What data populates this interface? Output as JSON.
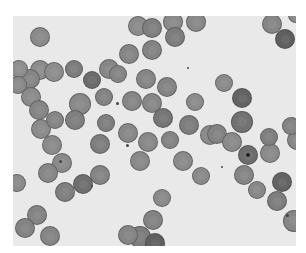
{
  "image": {
    "subject": "microscopy-blood-smear",
    "description": "Grayscale light micrograph of red blood cells (erythrocytes) on a pale background",
    "background_color": "#e9e9e9",
    "border_color": "#ffffff"
  },
  "cells": [
    {
      "x": 40,
      "y": 37,
      "r": 10,
      "c": "#8a8a8a"
    },
    {
      "x": 40,
      "y": 70,
      "r": 10,
      "c": "#8d8d8d"
    },
    {
      "x": 30,
      "y": 79,
      "r": 10,
      "c": "#868686"
    },
    {
      "x": 19,
      "y": 69,
      "r": 9,
      "c": "#8e8e8e"
    },
    {
      "x": 18,
      "y": 85,
      "r": 9,
      "c": "#8a8a8a"
    },
    {
      "x": 31,
      "y": 97,
      "r": 10,
      "c": "#8b8b8b"
    },
    {
      "x": 54,
      "y": 72,
      "r": 10,
      "c": "#8d8d8d"
    },
    {
      "x": 74,
      "y": 69,
      "r": 9,
      "c": "#7d7d7d"
    },
    {
      "x": 92,
      "y": 80,
      "r": 9,
      "c": "#6c6c6c"
    },
    {
      "x": 109,
      "y": 69,
      "r": 10,
      "c": "#878787"
    },
    {
      "x": 104,
      "y": 97,
      "r": 9,
      "c": "#838383"
    },
    {
      "x": 80,
      "y": 104,
      "r": 11,
      "c": "#898989"
    },
    {
      "x": 39,
      "y": 110,
      "r": 10,
      "c": "#858585"
    },
    {
      "x": 41,
      "y": 129,
      "r": 10,
      "c": "#8b8b8b"
    },
    {
      "x": 55,
      "y": 120,
      "r": 9,
      "c": "#858585"
    },
    {
      "x": 52,
      "y": 145,
      "r": 10,
      "c": "#8b8b8b"
    },
    {
      "x": 75,
      "y": 120,
      "r": 10,
      "c": "#7f7f7f"
    },
    {
      "x": 106,
      "y": 123,
      "r": 9,
      "c": "#7f7f7f"
    },
    {
      "x": 100,
      "y": 144,
      "r": 10,
      "c": "#7e7e7e"
    },
    {
      "x": 62,
      "y": 163,
      "r": 10,
      "c": "#8a8a8a"
    },
    {
      "x": 100,
      "y": 175,
      "r": 10,
      "c": "#848484"
    },
    {
      "x": 83,
      "y": 184,
      "r": 10,
      "c": "#6f6f6f"
    },
    {
      "x": 48,
      "y": 173,
      "r": 10,
      "c": "#878787"
    },
    {
      "x": 65,
      "y": 192,
      "r": 10,
      "c": "#7f7f7f"
    },
    {
      "x": 37,
      "y": 215,
      "r": 10,
      "c": "#848484"
    },
    {
      "x": 25,
      "y": 228,
      "r": 10,
      "c": "#838383"
    },
    {
      "x": 50,
      "y": 236,
      "r": 10,
      "c": "#858585"
    },
    {
      "x": 17,
      "y": 183,
      "r": 9,
      "c": "#8b8b8b"
    },
    {
      "x": 138,
      "y": 26,
      "r": 10,
      "c": "#8b8b8b"
    },
    {
      "x": 152,
      "y": 28,
      "r": 10,
      "c": "#7f7f7f"
    },
    {
      "x": 173,
      "y": 22,
      "r": 10,
      "c": "#8a8a8a"
    },
    {
      "x": 196,
      "y": 22,
      "r": 10,
      "c": "#888888"
    },
    {
      "x": 175,
      "y": 37,
      "r": 10,
      "c": "#7d7d7d"
    },
    {
      "x": 152,
      "y": 50,
      "r": 10,
      "c": "#838383"
    },
    {
      "x": 129,
      "y": 54,
      "r": 10,
      "c": "#858585"
    },
    {
      "x": 118,
      "y": 74,
      "r": 9,
      "c": "#858585"
    },
    {
      "x": 146,
      "y": 79,
      "r": 10,
      "c": "#868686"
    },
    {
      "x": 167,
      "y": 87,
      "r": 10,
      "c": "#848484"
    },
    {
      "x": 152,
      "y": 103,
      "r": 10,
      "c": "#878787"
    },
    {
      "x": 132,
      "y": 101,
      "r": 10,
      "c": "#868686"
    },
    {
      "x": 163,
      "y": 118,
      "r": 10,
      "c": "#767676"
    },
    {
      "x": 189,
      "y": 125,
      "r": 10,
      "c": "#7d7d7d"
    },
    {
      "x": 210,
      "y": 135,
      "r": 10,
      "c": "#8b8b8b"
    },
    {
      "x": 170,
      "y": 140,
      "r": 9,
      "c": "#848484"
    },
    {
      "x": 148,
      "y": 142,
      "r": 10,
      "c": "#888888"
    },
    {
      "x": 128,
      "y": 133,
      "r": 10,
      "c": "#888888"
    },
    {
      "x": 140,
      "y": 161,
      "r": 10,
      "c": "#898989"
    },
    {
      "x": 183,
      "y": 161,
      "r": 10,
      "c": "#8a8a8a"
    },
    {
      "x": 201,
      "y": 176,
      "r": 9,
      "c": "#8a8a8a"
    },
    {
      "x": 162,
      "y": 198,
      "r": 9,
      "c": "#8a8a8a"
    },
    {
      "x": 153,
      "y": 220,
      "r": 10,
      "c": "#838383"
    },
    {
      "x": 140,
      "y": 237,
      "r": 11,
      "c": "#7d7d7d"
    },
    {
      "x": 155,
      "y": 243,
      "r": 10,
      "c": "#606060"
    },
    {
      "x": 128,
      "y": 235,
      "r": 10,
      "c": "#858585"
    },
    {
      "x": 195,
      "y": 102,
      "r": 9,
      "c": "#8b8b8b"
    },
    {
      "x": 224,
      "y": 83,
      "r": 9,
      "c": "#8a8a8a"
    },
    {
      "x": 242,
      "y": 98,
      "r": 10,
      "c": "#636363"
    },
    {
      "x": 242,
      "y": 122,
      "r": 11,
      "c": "#727272"
    },
    {
      "x": 217,
      "y": 134,
      "r": 10,
      "c": "#838383"
    },
    {
      "x": 248,
      "y": 155,
      "r": 10,
      "c": "#6d6d6d",
      "nucleus": true
    },
    {
      "x": 232,
      "y": 142,
      "r": 10,
      "c": "#8a8a8a"
    },
    {
      "x": 270,
      "y": 153,
      "r": 10,
      "c": "#8a8a8a"
    },
    {
      "x": 244,
      "y": 175,
      "r": 10,
      "c": "#858585"
    },
    {
      "x": 257,
      "y": 190,
      "r": 9,
      "c": "#888888"
    },
    {
      "x": 282,
      "y": 182,
      "r": 10,
      "c": "#636363"
    },
    {
      "x": 277,
      "y": 201,
      "r": 10,
      "c": "#7e7e7e"
    },
    {
      "x": 294,
      "y": 221,
      "r": 11,
      "c": "#868686"
    },
    {
      "x": 272,
      "y": 24,
      "r": 10,
      "c": "#868686"
    },
    {
      "x": 285,
      "y": 39,
      "r": 10,
      "c": "#5f5f5f"
    },
    {
      "x": 296,
      "y": 15,
      "r": 8,
      "c": "#8a8a8a"
    },
    {
      "x": 297,
      "y": 140,
      "r": 10,
      "c": "#888888"
    },
    {
      "x": 291,
      "y": 126,
      "r": 9,
      "c": "#838383"
    },
    {
      "x": 269,
      "y": 137,
      "r": 9,
      "c": "#7f7f7f"
    }
  ],
  "dots": [
    {
      "x": 117,
      "y": 103,
      "r": 1.5
    },
    {
      "x": 60,
      "y": 161,
      "r": 1.5
    },
    {
      "x": 92,
      "y": 186,
      "r": 1.2
    },
    {
      "x": 127,
      "y": 145,
      "r": 1.5
    },
    {
      "x": 287,
      "y": 215,
      "r": 1.5
    },
    {
      "x": 222,
      "y": 167,
      "r": 1
    },
    {
      "x": 188,
      "y": 68,
      "r": 1.2
    }
  ]
}
